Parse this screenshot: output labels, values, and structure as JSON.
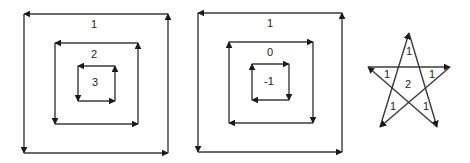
{
  "figure": {
    "panels": [
      {
        "id": "nested-squares-a",
        "loops": [
          {
            "label": "1",
            "orientation": "counterclockwise",
            "rect": {
              "x1": 24,
              "y1": 14,
              "x2": 168,
              "y2": 153
            },
            "label_pos": {
              "x": 94,
              "y": 25
            }
          },
          {
            "label": "2",
            "orientation": "counterclockwise",
            "rect": {
              "x1": 55,
              "y1": 43,
              "x2": 138,
              "y2": 124
            },
            "label_pos": {
              "x": 94,
              "y": 55
            }
          },
          {
            "label": "3",
            "orientation": "counterclockwise",
            "rect": {
              "x1": 78,
              "y1": 66,
              "x2": 115,
              "y2": 101
            },
            "label_pos": {
              "x": 95,
              "y": 83
            }
          }
        ]
      },
      {
        "id": "nested-squares-b",
        "loops": [
          {
            "label": "1",
            "orientation": "counterclockwise",
            "rect": {
              "x1": 198,
              "y1": 13,
              "x2": 342,
              "y2": 152
            },
            "label_pos": {
              "x": 270,
              "y": 24
            }
          },
          {
            "label": "0",
            "orientation": "clockwise",
            "rect": {
              "x1": 229,
              "y1": 42,
              "x2": 313,
              "y2": 123
            },
            "label_pos": {
              "x": 270,
              "y": 53
            }
          },
          {
            "label": "-1",
            "orientation": "clockwise",
            "rect": {
              "x1": 252,
              "y1": 64,
              "x2": 289,
              "y2": 100
            },
            "label_pos": {
              "x": 269,
              "y": 82
            }
          }
        ]
      },
      {
        "id": "pentagram",
        "vertices_in_order": [
          {
            "name": "bottom-left",
            "x": 380,
            "y": 127
          },
          {
            "name": "top",
            "x": 409,
            "y": 33
          },
          {
            "name": "bottom-right",
            "x": 437,
            "y": 127
          },
          {
            "name": "left",
            "x": 368,
            "y": 67
          },
          {
            "name": "right",
            "x": 450,
            "y": 67
          }
        ],
        "region_labels": [
          {
            "label": "1",
            "x": 409,
            "y": 52
          },
          {
            "label": "1",
            "x": 387,
            "y": 75
          },
          {
            "label": "1",
            "x": 432,
            "y": 75
          },
          {
            "label": "2",
            "x": 408,
            "y": 85
          },
          {
            "label": "1",
            "x": 393,
            "y": 107
          },
          {
            "label": "1",
            "x": 426,
            "y": 107
          }
        ]
      }
    ],
    "colors": {
      "stroke": "#3a3a3a",
      "text": "#222222",
      "background": "#ffffff"
    }
  }
}
